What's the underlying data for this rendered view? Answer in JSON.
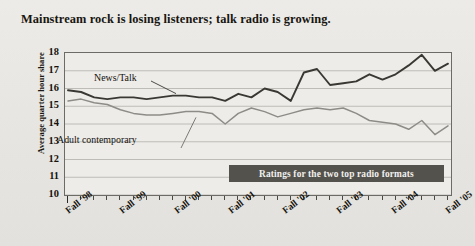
{
  "title": "Mainstream rock is losing listeners; talk radio is growing.",
  "callout": {
    "text": "Ratings for the two top radio formats"
  },
  "axes": {
    "y_title": "Average quarter hour share",
    "y_ticks": [
      "18",
      "17",
      "16",
      "15",
      "14",
      "13",
      "12",
      "11",
      "10"
    ],
    "x_ticks": [
      "Fall '98",
      "Fall '99",
      "Fall '00",
      "Fall '01",
      "Fall '02",
      "Fall '03",
      "Fall '04",
      "Fall '05"
    ]
  },
  "series_labels": {
    "news_talk": "News/Talk",
    "adult_contemporary": "Adult contemporary"
  },
  "colors": {
    "page_background": "#e9e8e5",
    "plot_background": "#edece9",
    "gridline": "#b9b7b1",
    "frame": "#6d6b66",
    "news_talk": "#3a3832",
    "adult_contemporary": "#8e8c86",
    "callout_background": "#54524d",
    "callout_text": "#f2f1ee",
    "text": "#17150f"
  },
  "chart_data": {
    "type": "line",
    "title": "Mainstream rock is losing listeners; talk radio is growing.",
    "xlabel": "",
    "ylabel": "Average quarter hour share",
    "ylim": [
      10,
      18
    ],
    "grid": true,
    "legend": "inline-annotations",
    "annotations": [
      {
        "text": "News/Talk",
        "series": "News/Talk"
      },
      {
        "text": "Adult contemporary",
        "series": "Adult contemporary"
      },
      {
        "text": "Ratings for the two top radio formats",
        "role": "callout-box"
      }
    ],
    "x_tick_labels": [
      "Fall '98",
      "Fall '99",
      "Fall '00",
      "Fall '01",
      "Fall '02",
      "Fall '03",
      "Fall '04",
      "Fall '05"
    ],
    "x": [
      0,
      1,
      2,
      3,
      4,
      5,
      6,
      7,
      8,
      9,
      10,
      11,
      12,
      13,
      14,
      15,
      16,
      17,
      18,
      19,
      20,
      21,
      22,
      23,
      24,
      25,
      26,
      27,
      28,
      29
    ],
    "series": [
      {
        "name": "News/Talk",
        "color": "#3a3832",
        "values": [
          15.9,
          15.8,
          15.5,
          15.4,
          15.5,
          15.5,
          15.4,
          15.5,
          15.6,
          15.6,
          15.5,
          15.5,
          15.3,
          15.7,
          15.5,
          16.0,
          15.8,
          15.3,
          16.9,
          17.1,
          16.2,
          16.3,
          16.4,
          16.8,
          16.5,
          16.8,
          17.3,
          17.9,
          17.0,
          17.4
        ]
      },
      {
        "name": "Adult contemporary",
        "color": "#8e8c86",
        "values": [
          15.3,
          15.4,
          15.2,
          15.1,
          14.8,
          14.6,
          14.5,
          14.5,
          14.6,
          14.7,
          14.7,
          14.6,
          14.0,
          14.6,
          14.9,
          14.7,
          14.4,
          14.6,
          14.8,
          14.9,
          14.8,
          14.9,
          14.6,
          14.2,
          14.1,
          14.0,
          13.7,
          14.2,
          13.4,
          13.9
        ]
      }
    ]
  }
}
